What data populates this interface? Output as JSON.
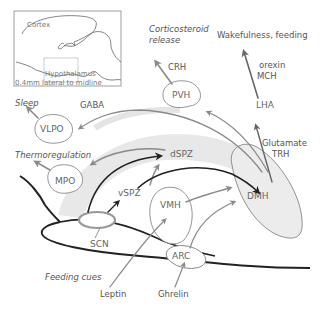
{
  "inset": {
    "cortex_label": "Cortex",
    "hypothalamus_label": "Hypothalamus",
    "section_caption": "0.4mm lateral to midline"
  },
  "nuclei": {
    "vlpo": "VLPO",
    "mpo": "MPO",
    "pvh": "PVH",
    "lha": "LHA",
    "dmh": "DMH",
    "dspz": "dSPZ",
    "vspz": "vSPZ",
    "scn": "SCN",
    "vmh": "VMH",
    "arc": "ARC"
  },
  "outputs": {
    "sleep": "Sleep",
    "thermoregulation": "Thermoregulation",
    "corticosteroid_line1": "Corticosteroid",
    "corticosteroid_line2": "release",
    "wakefulness": "Wakefulness, feeding",
    "feeding_cues": "Feeding cues"
  },
  "transmitters": {
    "gaba": "GABA",
    "crh": "CRH",
    "orexin": "orexin",
    "mch": "MCH",
    "glutamate": "Glutamate",
    "trh": "TRH",
    "leptin": "Leptin",
    "ghrelin": "Ghrelin"
  },
  "colors": {
    "grey_arrow": "#8a8a8a",
    "dark_arrow": "#222222",
    "band_fill": "#e6e6e6",
    "outline": "#777777",
    "scn_outline": "#999999"
  }
}
